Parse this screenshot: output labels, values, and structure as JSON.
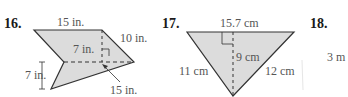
{
  "problems": [
    {
      "number": "16.",
      "labels": {
        "top": "15 in.",
        "right_side": "10 in.",
        "height_inner": "7 in.",
        "height_left": "7 in.",
        "dashed_base": "15 in."
      }
    },
    {
      "number": "17.",
      "labels": {
        "top": "15.7 cm",
        "height": "9 cm",
        "left_side": "11 cm",
        "right_side": "12 cm"
      }
    },
    {
      "number": "18.",
      "labels": {
        "side": "3 m"
      }
    }
  ],
  "colors": {
    "fill": "#dcdcdc",
    "stroke": "#333333",
    "text": "#555555"
  }
}
